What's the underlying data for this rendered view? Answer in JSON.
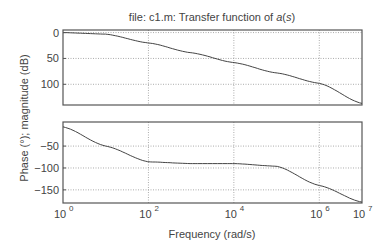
{
  "title": {
    "prefix": "file: c1.m: Transfer function of ",
    "italic": "a",
    "suffix_open": "(",
    "italic2": "s",
    "suffix_close": ")"
  },
  "ylabel": "Phase (°); magnitude (dB)",
  "xlabel": "Frequency (rad/s)",
  "chart_data": [
    {
      "type": "line",
      "title": "Magnitude",
      "xscale": "log",
      "xlim": [
        1,
        10000000
      ],
      "ylim": [
        -40,
        105
      ],
      "yticks": [
        0,
        50,
        100
      ],
      "grid": true,
      "x": [
        1,
        10,
        100,
        1000,
        10000,
        100000,
        1000000,
        10000000
      ],
      "series": [
        {
          "name": "magnitude (dB)",
          "values": [
            100,
            97,
            80,
            61,
            42,
            22,
            2,
            -37
          ]
        }
      ]
    },
    {
      "type": "line",
      "title": "Phase",
      "xscale": "log",
      "xlim": [
        1,
        10000000
      ],
      "ylim": [
        -180,
        5
      ],
      "yticks": [
        -50,
        -100,
        -150
      ],
      "xticks": [
        "10^0",
        "10^2",
        "10^4",
        "10^6",
        "10^7"
      ],
      "grid": true,
      "x": [
        1,
        10,
        100,
        1000,
        10000,
        100000,
        1000000,
        10000000
      ],
      "series": [
        {
          "name": "phase (°)",
          "values": [
            -6,
            -50,
            -86,
            -90,
            -90,
            -96,
            -140,
            -178
          ]
        }
      ]
    }
  ],
  "axes": {
    "top_yticks": [
      "100",
      "50",
      "0"
    ],
    "bottom_yticks": [
      "−50",
      "−100",
      "−150"
    ],
    "xticks": [
      {
        "base": "10",
        "exp": "0"
      },
      {
        "base": "10",
        "exp": "2"
      },
      {
        "base": "10",
        "exp": "4"
      },
      {
        "base": "10",
        "exp": "6"
      },
      {
        "base": "10",
        "exp": "7"
      }
    ]
  }
}
